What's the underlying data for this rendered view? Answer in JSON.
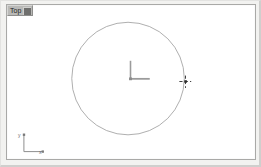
{
  "window": {
    "title": "Top Viewport",
    "background_color": "#f2f2f0",
    "viewport_background_color": "#ffffff",
    "border_color": "#a9a9a7"
  },
  "viewport": {
    "label": "Top",
    "label_menu_icon": "viewport-menu-icon",
    "label_background_color": "#b9b9b7",
    "projection": "orthographic"
  },
  "axis_tripod": {
    "name": "world-axis-tripod",
    "y_label": "y",
    "x_label": "x",
    "color": "#888888",
    "origin_x": 22,
    "origin_y": 152,
    "arm_length": 18
  },
  "scene": {
    "objects": [
      {
        "name": "circle-spline",
        "type": "circle",
        "center_x": 128,
        "center_y": 78,
        "radius": 57,
        "stroke_color": "#9a9a9a",
        "stroke_width": 0.8
      }
    ]
  },
  "gizmo": {
    "name": "transform-gizmo",
    "type": "pivot-axis-tripod",
    "origin_x": 130,
    "origin_y": 78,
    "y_arm_length": 18,
    "x_arm_length": 20,
    "color": "#9b9b9b"
  },
  "cursor": {
    "name": "crosshair-cursor",
    "type": "crosshair",
    "x": 186,
    "y": 81,
    "color": "#3a3a3a",
    "size": 11
  }
}
